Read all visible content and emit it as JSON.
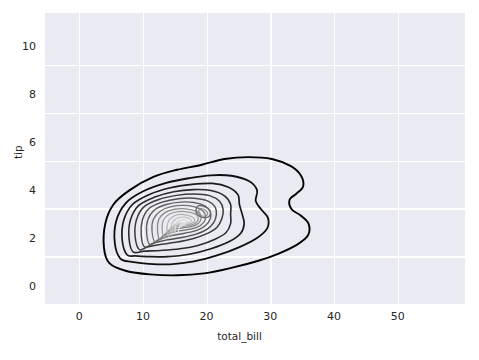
{
  "chart_data": {
    "type": "line",
    "subtype": "kde-contour",
    "title": "",
    "xlabel": "total_bill",
    "ylabel": "tip",
    "xlim": [
      -5.5,
      56.5
    ],
    "ylim": [
      -0.8,
      11.4
    ],
    "xticks": [
      0,
      10,
      20,
      30,
      40,
      50
    ],
    "xticklabels": [
      "0",
      "10",
      "20",
      "30",
      "40",
      "50"
    ],
    "yticks": [
      0,
      2,
      4,
      6,
      8,
      10
    ],
    "yticklabels": [
      "0",
      "2",
      "4",
      "6",
      "8",
      "10"
    ],
    "grid": true,
    "legend": null,
    "style": "darkgrid",
    "axes_facecolor": "#eaeaf2",
    "figure_facecolor": "#ffffff",
    "gridcolor": "#ffffff",
    "textcolor": "#262626",
    "cmap": "Greys_r",
    "n_levels": 14,
    "density_peak": {
      "total_bill": 15.0,
      "tip": 2.1
    },
    "contours": [
      {
        "level": 1,
        "shade": "#000000",
        "width": 1.9,
        "points": [
          [
            4.0,
            0.95
          ],
          [
            3.2,
            1.6
          ],
          [
            3.4,
            2.6
          ],
          [
            4.6,
            3.4
          ],
          [
            7.0,
            4.0
          ],
          [
            10.5,
            4.55
          ],
          [
            14.0,
            4.85
          ],
          [
            17.5,
            5.05
          ],
          [
            21.0,
            5.3
          ],
          [
            24.5,
            5.38
          ],
          [
            28.0,
            5.3
          ],
          [
            30.8,
            5.0
          ],
          [
            32.3,
            4.6
          ],
          [
            32.6,
            4.15
          ],
          [
            31.6,
            3.85
          ],
          [
            30.6,
            3.6
          ],
          [
            30.9,
            3.2
          ],
          [
            32.2,
            2.95
          ],
          [
            33.4,
            2.6
          ],
          [
            33.3,
            2.1
          ],
          [
            31.6,
            1.7
          ],
          [
            29.0,
            1.35
          ],
          [
            26.0,
            1.05
          ],
          [
            22.0,
            0.75
          ],
          [
            18.0,
            0.52
          ],
          [
            14.0,
            0.44
          ],
          [
            10.0,
            0.48
          ],
          [
            6.5,
            0.62
          ]
        ]
      },
      {
        "level": 2,
        "shade": "#0e0e0e",
        "width": 1.8,
        "points": [
          [
            5.6,
            1.15
          ],
          [
            4.8,
            1.8
          ],
          [
            5.0,
            2.7
          ],
          [
            6.4,
            3.45
          ],
          [
            9.0,
            3.95
          ],
          [
            12.4,
            4.3
          ],
          [
            15.8,
            4.5
          ],
          [
            19.0,
            4.62
          ],
          [
            22.0,
            4.6
          ],
          [
            24.6,
            4.38
          ],
          [
            25.8,
            4.0
          ],
          [
            25.6,
            3.55
          ],
          [
            26.4,
            3.2
          ],
          [
            27.4,
            2.85
          ],
          [
            27.3,
            2.4
          ],
          [
            25.8,
            2.0
          ],
          [
            23.2,
            1.62
          ],
          [
            20.0,
            1.28
          ],
          [
            16.5,
            1.02
          ],
          [
            13.0,
            0.9
          ],
          [
            9.8,
            0.92
          ],
          [
            7.3,
            1.0
          ]
        ]
      },
      {
        "level": 3,
        "shade": "#1b1b1b",
        "width": 1.7,
        "points": [
          [
            6.6,
            1.3
          ],
          [
            5.9,
            1.9
          ],
          [
            6.1,
            2.72
          ],
          [
            7.4,
            3.4
          ],
          [
            9.9,
            3.82
          ],
          [
            13.0,
            4.1
          ],
          [
            16.2,
            4.24
          ],
          [
            19.2,
            4.28
          ],
          [
            21.6,
            4.12
          ],
          [
            23.0,
            3.8
          ],
          [
            23.2,
            3.4
          ],
          [
            23.6,
            3.0
          ],
          [
            23.9,
            2.6
          ],
          [
            23.4,
            2.2
          ],
          [
            21.7,
            1.85
          ],
          [
            19.0,
            1.55
          ],
          [
            15.8,
            1.32
          ],
          [
            12.6,
            1.22
          ],
          [
            9.6,
            1.22
          ],
          [
            7.8,
            1.25
          ]
        ]
      },
      {
        "level": 4,
        "shade": "#2b2b2b",
        "width": 1.6,
        "points": [
          [
            7.5,
            1.42
          ],
          [
            6.9,
            2.0
          ],
          [
            7.1,
            2.74
          ],
          [
            8.3,
            3.35
          ],
          [
            10.6,
            3.7
          ],
          [
            13.5,
            3.93
          ],
          [
            16.4,
            4.02
          ],
          [
            19.0,
            3.98
          ],
          [
            21.0,
            3.76
          ],
          [
            21.9,
            3.4
          ],
          [
            21.9,
            3.0
          ],
          [
            21.9,
            2.6
          ],
          [
            21.2,
            2.22
          ],
          [
            19.6,
            1.95
          ],
          [
            17.2,
            1.7
          ],
          [
            14.4,
            1.55
          ],
          [
            11.6,
            1.48
          ],
          [
            9.2,
            1.45
          ]
        ]
      },
      {
        "level": 5,
        "shade": "#3b3b3b",
        "width": 1.5,
        "points": [
          [
            8.4,
            1.52
          ],
          [
            7.8,
            2.08
          ],
          [
            8.0,
            2.76
          ],
          [
            9.1,
            3.3
          ],
          [
            11.2,
            3.6
          ],
          [
            13.9,
            3.78
          ],
          [
            16.5,
            3.84
          ],
          [
            18.8,
            3.77
          ],
          [
            20.3,
            3.52
          ],
          [
            20.8,
            3.18
          ],
          [
            20.6,
            2.8
          ],
          [
            19.9,
            2.45
          ],
          [
            18.4,
            2.18
          ],
          [
            16.3,
            1.97
          ],
          [
            13.8,
            1.82
          ],
          [
            11.3,
            1.72
          ],
          [
            9.6,
            1.62
          ]
        ]
      },
      {
        "level": 6,
        "shade": "#4d4d4d",
        "width": 1.45,
        "points": [
          [
            9.2,
            1.62
          ],
          [
            8.7,
            2.15
          ],
          [
            8.9,
            2.77
          ],
          [
            9.9,
            3.24
          ],
          [
            11.8,
            3.5
          ],
          [
            14.2,
            3.64
          ],
          [
            16.5,
            3.66
          ],
          [
            18.5,
            3.55
          ],
          [
            19.6,
            3.3
          ],
          [
            19.8,
            2.98
          ],
          [
            19.4,
            2.64
          ],
          [
            18.4,
            2.36
          ],
          [
            16.8,
            2.16
          ],
          [
            14.7,
            2.02
          ],
          [
            12.5,
            1.92
          ],
          [
            10.5,
            1.78
          ]
        ]
      },
      {
        "level": 7,
        "shade": "#606060",
        "width": 1.4,
        "points": [
          [
            10.0,
            1.72
          ],
          [
            9.5,
            2.22
          ],
          [
            9.7,
            2.78
          ],
          [
            10.7,
            3.18
          ],
          [
            12.4,
            3.4
          ],
          [
            14.5,
            3.5
          ],
          [
            16.5,
            3.48
          ],
          [
            18.1,
            3.34
          ],
          [
            18.9,
            3.1
          ],
          [
            18.9,
            2.8
          ],
          [
            18.2,
            2.52
          ],
          [
            16.9,
            2.32
          ],
          [
            15.1,
            2.2
          ],
          [
            13.2,
            2.1
          ],
          [
            11.4,
            1.95
          ]
        ]
      },
      {
        "level": 8,
        "shade": "#747474",
        "width": 1.35,
        "points": [
          [
            10.8,
            1.82
          ],
          [
            10.3,
            2.28
          ],
          [
            10.5,
            2.78
          ],
          [
            11.5,
            3.12
          ],
          [
            13.0,
            3.3
          ],
          [
            14.9,
            3.36
          ],
          [
            16.6,
            3.3
          ],
          [
            17.8,
            3.14
          ],
          [
            18.2,
            2.9
          ],
          [
            17.9,
            2.64
          ],
          [
            16.9,
            2.44
          ],
          [
            15.4,
            2.34
          ],
          [
            13.6,
            2.26
          ],
          [
            12.1,
            2.12
          ]
        ]
      },
      {
        "level": 9,
        "shade": "#878787",
        "width": 1.3,
        "points": [
          [
            11.5,
            1.92
          ],
          [
            11.1,
            2.34
          ],
          [
            11.3,
            2.78
          ],
          [
            12.2,
            3.06
          ],
          [
            13.6,
            3.2
          ],
          [
            15.3,
            3.22
          ],
          [
            16.8,
            3.12
          ],
          [
            17.5,
            2.94
          ],
          [
            17.4,
            2.7
          ],
          [
            16.6,
            2.52
          ],
          [
            15.3,
            2.44
          ],
          [
            13.9,
            2.38
          ],
          [
            12.6,
            2.26
          ]
        ]
      },
      {
        "level": 10,
        "shade": "#9b9b9b",
        "width": 1.25,
        "points": [
          [
            12.1,
            2.0
          ],
          [
            11.8,
            2.38
          ],
          [
            12.0,
            2.76
          ],
          [
            12.9,
            3.0
          ],
          [
            14.2,
            3.1
          ],
          [
            15.7,
            3.08
          ],
          [
            16.9,
            2.96
          ],
          [
            17.1,
            2.76
          ],
          [
            16.5,
            2.58
          ],
          [
            15.3,
            2.5
          ],
          [
            14.0,
            2.46
          ],
          [
            12.9,
            2.36
          ]
        ]
      },
      {
        "level": 11,
        "shade": "#afafaf",
        "width": 1.2,
        "points": [
          [
            12.7,
            2.06
          ],
          [
            12.5,
            2.42
          ],
          [
            12.8,
            2.74
          ],
          [
            13.7,
            2.94
          ],
          [
            14.9,
            2.98
          ],
          [
            16.1,
            2.9
          ],
          [
            16.6,
            2.74
          ],
          [
            16.1,
            2.6
          ],
          [
            15.0,
            2.56
          ],
          [
            13.8,
            2.52
          ],
          [
            13.1,
            2.42
          ]
        ]
      },
      {
        "level": 12,
        "shade": "#c2c2c2",
        "width": 1.15,
        "points": [
          [
            13.2,
            2.12
          ],
          [
            13.1,
            2.44
          ],
          [
            13.5,
            2.72
          ],
          [
            14.4,
            2.86
          ],
          [
            15.4,
            2.86
          ],
          [
            16.1,
            2.74
          ],
          [
            15.8,
            2.62
          ],
          [
            14.8,
            2.6
          ],
          [
            13.8,
            2.58
          ],
          [
            13.4,
            2.46
          ]
        ]
      },
      {
        "level": 13,
        "shade": "#d4d4d4",
        "width": 1.1,
        "points": [
          [
            13.7,
            2.18
          ],
          [
            13.7,
            2.46
          ],
          [
            14.2,
            2.7
          ],
          [
            15.0,
            2.76
          ],
          [
            15.6,
            2.7
          ],
          [
            15.4,
            2.62
          ],
          [
            14.6,
            2.62
          ],
          [
            13.9,
            2.58
          ]
        ]
      },
      {
        "level": 14,
        "shade": "#e4e4e4",
        "width": 1.05,
        "points": [
          [
            14.2,
            2.26
          ],
          [
            14.4,
            2.5
          ],
          [
            15.0,
            2.6
          ],
          [
            15.2,
            2.56
          ],
          [
            14.7,
            2.5
          ],
          [
            14.3,
            2.42
          ]
        ]
      }
    ],
    "inner_blobs": [
      {
        "shade": "#6a6a6a",
        "width": 1.3,
        "points": [
          [
            17.2,
            3.35
          ],
          [
            18.3,
            3.28
          ],
          [
            18.9,
            3.1
          ],
          [
            18.7,
            2.9
          ],
          [
            17.8,
            2.86
          ],
          [
            17.0,
            2.98
          ],
          [
            16.8,
            3.18
          ]
        ]
      },
      {
        "shade": "#8c8c8c",
        "width": 1.2,
        "points": [
          [
            17.4,
            3.22
          ],
          [
            18.2,
            3.16
          ],
          [
            18.5,
            3.02
          ],
          [
            18.2,
            2.92
          ],
          [
            17.5,
            2.94
          ],
          [
            17.2,
            3.08
          ]
        ]
      }
    ]
  }
}
